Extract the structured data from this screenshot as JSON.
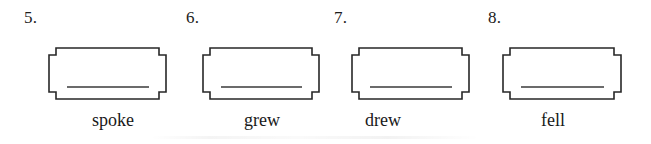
{
  "page": {
    "background_color": "#ffffff",
    "ink_color": "#272727"
  },
  "exercises": [
    {
      "number": "5.",
      "word": "spoke",
      "number_x": 24,
      "box_x": 49,
      "box_width": 117,
      "box_height": 51,
      "word_center_x": 113
    },
    {
      "number": "6.",
      "word": "grew",
      "number_x": 186,
      "box_x": 203,
      "box_width": 116,
      "box_height": 51,
      "word_center_x": 262
    },
    {
      "number": "7.",
      "word": "drew",
      "number_x": 334,
      "box_x": 352,
      "box_width": 117,
      "box_height": 51,
      "word_center_x": 383
    },
    {
      "number": "8.",
      "word": "fell",
      "number_x": 488,
      "box_x": 503,
      "box_width": 118,
      "box_height": 51,
      "word_center_x": 553
    }
  ]
}
